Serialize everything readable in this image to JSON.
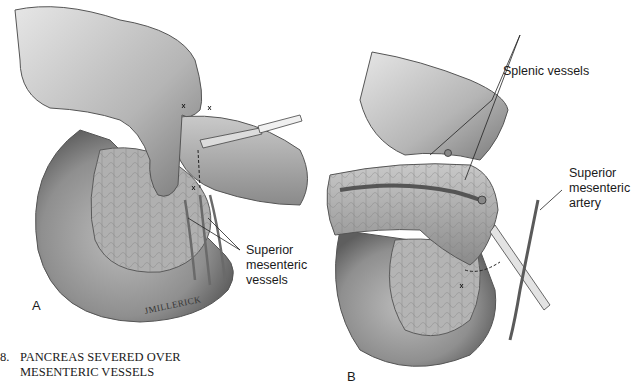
{
  "figure": {
    "number": "8.",
    "caption_lines": [
      "PANCREAS SEVERED OVER",
      "MESENTERIC VESSELS"
    ]
  },
  "panel_a": {
    "letter": "A",
    "labels": {
      "superior_mesenteric_vessels": "Superior\nmesenteric\nvessels"
    },
    "signature": "JMILLERICK"
  },
  "panel_b": {
    "letter": "B",
    "labels": {
      "splenic_vessels": "Splenic vessels",
      "superior_mesenteric_artery": "Superior\nmesenteric\nartery"
    }
  },
  "colors": {
    "background": "#ffffff",
    "text": "#1a1a1a",
    "tissue_light": "#d8d8d8",
    "tissue_mid": "#a9a9a9",
    "tissue_dark": "#6e6e6e"
  }
}
